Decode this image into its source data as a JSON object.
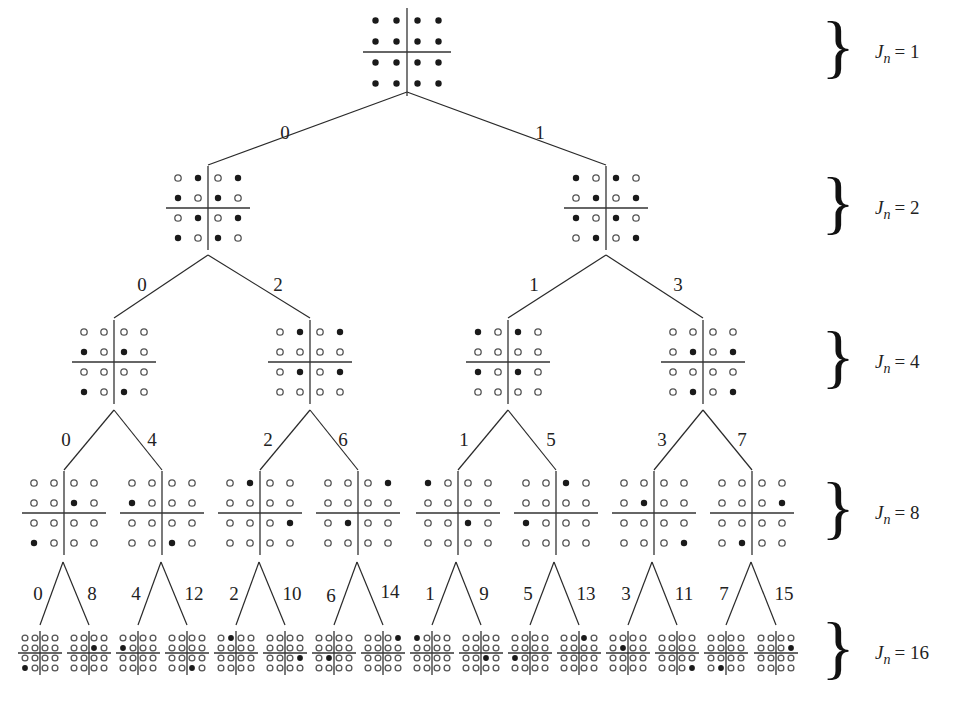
{
  "levels": [
    {
      "jn_label": "J",
      "jn_sub": "n",
      "jn_value": "= 1",
      "y": 52,
      "spacing": 21,
      "nodes": [
        {
          "index": 0,
          "cx": 407,
          "filled": [
            [
              0,
              0
            ],
            [
              0,
              1
            ],
            [
              0,
              2
            ],
            [
              0,
              3
            ],
            [
              1,
              0
            ],
            [
              1,
              1
            ],
            [
              1,
              2
            ],
            [
              1,
              3
            ],
            [
              2,
              0
            ],
            [
              2,
              1
            ],
            [
              2,
              2
            ],
            [
              2,
              3
            ],
            [
              3,
              0
            ],
            [
              3,
              1
            ],
            [
              3,
              2
            ],
            [
              3,
              3
            ]
          ]
        }
      ]
    },
    {
      "jn_label": "J",
      "jn_sub": "n",
      "jn_value": "= 2",
      "y": 208,
      "spacing": 20,
      "nodes": [
        {
          "index": 0,
          "cx": 208,
          "filled": [
            [
              0,
              1
            ],
            [
              0,
              3
            ],
            [
              1,
              0
            ],
            [
              1,
              2
            ],
            [
              2,
              1
            ],
            [
              2,
              3
            ],
            [
              3,
              0
            ],
            [
              3,
              2
            ]
          ]
        },
        {
          "index": 1,
          "cx": 606,
          "filled": [
            [
              0,
              0
            ],
            [
              0,
              2
            ],
            [
              1,
              1
            ],
            [
              1,
              3
            ],
            [
              2,
              0
            ],
            [
              2,
              2
            ],
            [
              3,
              1
            ],
            [
              3,
              3
            ]
          ]
        }
      ]
    },
    {
      "jn_label": "J",
      "jn_sub": "n",
      "jn_value": "= 4",
      "y": 362,
      "spacing": 20,
      "nodes": [
        {
          "index": 0,
          "cx": 114,
          "filled": [
            [
              1,
              0
            ],
            [
              1,
              2
            ],
            [
              3,
              0
            ],
            [
              3,
              2
            ]
          ]
        },
        {
          "index": 2,
          "cx": 310,
          "filled": [
            [
              0,
              1
            ],
            [
              0,
              3
            ],
            [
              2,
              1
            ],
            [
              2,
              3
            ]
          ]
        },
        {
          "index": 1,
          "cx": 508,
          "filled": [
            [
              0,
              0
            ],
            [
              0,
              2
            ],
            [
              2,
              0
            ],
            [
              2,
              2
            ]
          ]
        },
        {
          "index": 3,
          "cx": 703,
          "filled": [
            [
              1,
              1
            ],
            [
              1,
              3
            ],
            [
              3,
              1
            ],
            [
              3,
              3
            ]
          ]
        }
      ]
    },
    {
      "jn_label": "J",
      "jn_sub": "n",
      "jn_value": "= 8",
      "y": 513,
      "spacing": 20,
      "nodes": [
        {
          "index": 0,
          "cx": 64,
          "filled": [
            [
              1,
              2
            ],
            [
              3,
              0
            ]
          ]
        },
        {
          "index": 4,
          "cx": 162,
          "filled": [
            [
              1,
              0
            ],
            [
              3,
              2
            ]
          ]
        },
        {
          "index": 2,
          "cx": 260,
          "filled": [
            [
              0,
              1
            ],
            [
              2,
              3
            ]
          ]
        },
        {
          "index": 6,
          "cx": 358,
          "filled": [
            [
              0,
              3
            ],
            [
              2,
              1
            ]
          ]
        },
        {
          "index": 1,
          "cx": 458,
          "filled": [
            [
              0,
              0
            ],
            [
              2,
              2
            ]
          ]
        },
        {
          "index": 5,
          "cx": 556,
          "filled": [
            [
              0,
              2
            ],
            [
              2,
              0
            ]
          ]
        },
        {
          "index": 3,
          "cx": 654,
          "filled": [
            [
              1,
              1
            ],
            [
              3,
              3
            ]
          ]
        },
        {
          "index": 7,
          "cx": 752,
          "filled": [
            [
              1,
              3
            ],
            [
              3,
              1
            ]
          ]
        }
      ]
    },
    {
      "jn_label": "J",
      "jn_sub": "n",
      "jn_value": "= 16",
      "y": 653,
      "spacing": 10,
      "nodes": [
        {
          "index": 0,
          "cx": 40,
          "filled": [
            [
              3,
              0
            ]
          ]
        },
        {
          "index": 8,
          "cx": 89,
          "filled": [
            [
              1,
              2
            ]
          ]
        },
        {
          "index": 4,
          "cx": 138,
          "filled": [
            [
              1,
              0
            ]
          ]
        },
        {
          "index": 12,
          "cx": 187,
          "filled": [
            [
              3,
              2
            ]
          ]
        },
        {
          "index": 2,
          "cx": 236,
          "filled": [
            [
              0,
              1
            ]
          ]
        },
        {
          "index": 10,
          "cx": 285,
          "filled": [
            [
              2,
              3
            ]
          ]
        },
        {
          "index": 6,
          "cx": 334,
          "filled": [
            [
              2,
              1
            ]
          ]
        },
        {
          "index": 14,
          "cx": 383,
          "filled": [
            [
              0,
              3
            ]
          ]
        },
        {
          "index": 1,
          "cx": 432,
          "filled": [
            [
              0,
              0
            ]
          ]
        },
        {
          "index": 9,
          "cx": 481,
          "filled": [
            [
              2,
              2
            ]
          ]
        },
        {
          "index": 5,
          "cx": 530,
          "filled": [
            [
              2,
              0
            ]
          ]
        },
        {
          "index": 13,
          "cx": 579,
          "filled": [
            [
              0,
              2
            ]
          ]
        },
        {
          "index": 3,
          "cx": 628,
          "filled": [
            [
              1,
              1
            ]
          ]
        },
        {
          "index": 11,
          "cx": 677,
          "filled": [
            [
              3,
              3
            ]
          ]
        },
        {
          "index": 7,
          "cx": 726,
          "filled": [
            [
              3,
              1
            ]
          ]
        },
        {
          "index": 15,
          "cx": 776,
          "filled": [
            [
              1,
              3
            ]
          ]
        }
      ]
    }
  ],
  "edges": [
    {
      "x1": 407,
      "y1": 92,
      "x2": 208,
      "y2": 165,
      "label": "0",
      "lx": 285,
      "ly": 135
    },
    {
      "x1": 407,
      "y1": 92,
      "x2": 606,
      "y2": 165,
      "label": "1",
      "lx": 540,
      "ly": 135
    },
    {
      "x1": 208,
      "y1": 255,
      "x2": 114,
      "y2": 318,
      "label": "0",
      "lx": 142,
      "ly": 287
    },
    {
      "x1": 208,
      "y1": 255,
      "x2": 310,
      "y2": 318,
      "label": "2",
      "lx": 278,
      "ly": 287
    },
    {
      "x1": 606,
      "y1": 255,
      "x2": 508,
      "y2": 318,
      "label": "1",
      "lx": 534,
      "ly": 287
    },
    {
      "x1": 606,
      "y1": 255,
      "x2": 703,
      "y2": 318,
      "label": "3",
      "lx": 678,
      "ly": 287
    },
    {
      "x1": 114,
      "y1": 410,
      "x2": 64,
      "y2": 470,
      "label": "0",
      "lx": 66,
      "ly": 442
    },
    {
      "x1": 114,
      "y1": 410,
      "x2": 162,
      "y2": 470,
      "label": "4",
      "lx": 152,
      "ly": 442
    },
    {
      "x1": 310,
      "y1": 410,
      "x2": 260,
      "y2": 470,
      "label": "2",
      "lx": 268,
      "ly": 442
    },
    {
      "x1": 310,
      "y1": 410,
      "x2": 358,
      "y2": 470,
      "label": "6",
      "lx": 343,
      "ly": 442
    },
    {
      "x1": 508,
      "y1": 410,
      "x2": 458,
      "y2": 470,
      "label": "1",
      "lx": 464,
      "ly": 442
    },
    {
      "x1": 508,
      "y1": 410,
      "x2": 556,
      "y2": 470,
      "label": "5",
      "lx": 551,
      "ly": 442
    },
    {
      "x1": 703,
      "y1": 410,
      "x2": 654,
      "y2": 470,
      "label": "3",
      "lx": 662,
      "ly": 442
    },
    {
      "x1": 703,
      "y1": 410,
      "x2": 752,
      "y2": 470,
      "label": "7",
      "lx": 742,
      "ly": 442
    },
    {
      "x1": 63,
      "y1": 562,
      "x2": 40,
      "y2": 625,
      "label": "0",
      "lx": 38,
      "ly": 596
    },
    {
      "x1": 63,
      "y1": 562,
      "x2": 89,
      "y2": 625,
      "label": "8",
      "lx": 92,
      "ly": 596
    },
    {
      "x1": 161,
      "y1": 562,
      "x2": 138,
      "y2": 625,
      "label": "4",
      "lx": 136,
      "ly": 596
    },
    {
      "x1": 161,
      "y1": 562,
      "x2": 187,
      "y2": 625,
      "label": "12",
      "lx": 194,
      "ly": 596
    },
    {
      "x1": 259,
      "y1": 562,
      "x2": 236,
      "y2": 625,
      "label": "2",
      "lx": 234,
      "ly": 596
    },
    {
      "x1": 259,
      "y1": 562,
      "x2": 285,
      "y2": 625,
      "label": "10",
      "lx": 292,
      "ly": 596
    },
    {
      "x1": 357,
      "y1": 562,
      "x2": 334,
      "y2": 625,
      "label": "6",
      "lx": 331,
      "ly": 598
    },
    {
      "x1": 357,
      "y1": 562,
      "x2": 383,
      "y2": 625,
      "label": "14",
      "lx": 390,
      "ly": 594
    },
    {
      "x1": 456,
      "y1": 562,
      "x2": 432,
      "y2": 625,
      "label": "1",
      "lx": 430,
      "ly": 596
    },
    {
      "x1": 456,
      "y1": 562,
      "x2": 481,
      "y2": 625,
      "label": "9",
      "lx": 484,
      "ly": 596
    },
    {
      "x1": 554,
      "y1": 562,
      "x2": 530,
      "y2": 625,
      "label": "5",
      "lx": 528,
      "ly": 596
    },
    {
      "x1": 554,
      "y1": 562,
      "x2": 579,
      "y2": 625,
      "label": "13",
      "lx": 586,
      "ly": 596
    },
    {
      "x1": 652,
      "y1": 562,
      "x2": 628,
      "y2": 625,
      "label": "3",
      "lx": 626,
      "ly": 596
    },
    {
      "x1": 652,
      "y1": 562,
      "x2": 677,
      "y2": 625,
      "label": "11",
      "lx": 684,
      "ly": 596
    },
    {
      "x1": 751,
      "y1": 562,
      "x2": 726,
      "y2": 625,
      "label": "7",
      "lx": 724,
      "ly": 596
    },
    {
      "x1": 751,
      "y1": 562,
      "x2": 776,
      "y2": 625,
      "label": "15",
      "lx": 784,
      "ly": 596
    }
  ],
  "brace": {
    "glyph": "}",
    "x": 838
  },
  "jn_label_x": 875
}
